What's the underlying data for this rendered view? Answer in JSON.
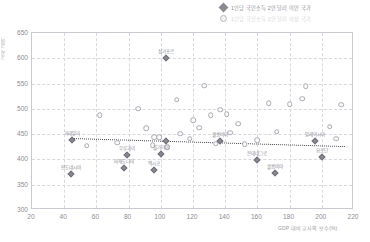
{
  "legend": {
    "items": [
      {
        "marker": "diamond",
        "label": "1인당 국민소득 2만 달러 미만 국가",
        "faint": false
      },
      {
        "marker": "circle",
        "label": "1인당 국민소득 2만 달러 이상 국가",
        "faint": true
      }
    ]
  },
  "chart_data": {
    "type": "scatter",
    "title": "",
    "xlabel": "GDP 대비 교사의 보수(%)",
    "ylabel": "교사 급여",
    "xlim": [
      20,
      220
    ],
    "ylim": [
      300,
      650
    ],
    "xticks": [
      20,
      40,
      60,
      80,
      100,
      120,
      140,
      160,
      180,
      200,
      220
    ],
    "yticks": [
      300,
      350,
      400,
      450,
      500,
      550,
      600,
      650
    ],
    "grid": true,
    "legend_position": "top-right",
    "series": [
      {
        "name": "1인당 국민소득 2만 달러 미만 국가",
        "marker": "diamond",
        "points": [
          {
            "x": 103,
            "y": 601,
            "label": "싱가포르"
          },
          {
            "x": 45,
            "y": 438,
            "label": "과테말라"
          },
          {
            "x": 44,
            "y": 371,
            "label": "인도네시아"
          },
          {
            "x": 79,
            "y": 408,
            "label": "우루과이"
          },
          {
            "x": 77,
            "y": 383,
            "label": "마케도니아"
          },
          {
            "x": 100,
            "y": 411,
            "label": "불가리아"
          },
          {
            "x": 96,
            "y": 379,
            "label": "멕시코"
          },
          {
            "x": 103,
            "y": 436,
            "label": ""
          },
          {
            "x": 137,
            "y": 437,
            "label": "콜롬비아"
          },
          {
            "x": 160,
            "y": 399,
            "label": "몬테네그로"
          },
          {
            "x": 171,
            "y": 374,
            "label": "콜롬비아"
          },
          {
            "x": 196,
            "y": 437,
            "label": "말레이시아"
          },
          {
            "x": 200,
            "y": 404,
            "label": "요르단"
          }
        ]
      },
      {
        "name": "1인당 국민소득 2만 달러 이상 국가",
        "marker": "circle",
        "points": [
          {
            "x": 54,
            "y": 427,
            "label": ""
          },
          {
            "x": 62,
            "y": 487,
            "label": ""
          },
          {
            "x": 73,
            "y": 433,
            "label": ""
          },
          {
            "x": 86,
            "y": 500,
            "label": ""
          },
          {
            "x": 91,
            "y": 462,
            "label": ""
          },
          {
            "x": 95,
            "y": 428,
            "label": ""
          },
          {
            "x": 96,
            "y": 444,
            "label": ""
          },
          {
            "x": 99,
            "y": 444,
            "label": ""
          },
          {
            "x": 104,
            "y": 424,
            "label": ""
          },
          {
            "x": 110,
            "y": 518,
            "label": ""
          },
          {
            "x": 112,
            "y": 451,
            "label": ""
          },
          {
            "x": 118,
            "y": 441,
            "label": ""
          },
          {
            "x": 120,
            "y": 477,
            "label": ""
          },
          {
            "x": 124,
            "y": 463,
            "label": ""
          },
          {
            "x": 127,
            "y": 546,
            "label": ""
          },
          {
            "x": 131,
            "y": 488,
            "label": ""
          },
          {
            "x": 134,
            "y": 431,
            "label": ""
          },
          {
            "x": 137,
            "y": 498,
            "label": ""
          },
          {
            "x": 141,
            "y": 490,
            "label": ""
          },
          {
            "x": 143,
            "y": 453,
            "label": ""
          },
          {
            "x": 148,
            "y": 471,
            "label": ""
          },
          {
            "x": 152,
            "y": 430,
            "label": ""
          },
          {
            "x": 160,
            "y": 438,
            "label": ""
          },
          {
            "x": 167,
            "y": 511,
            "label": ""
          },
          {
            "x": 172,
            "y": 455,
            "label": ""
          },
          {
            "x": 180,
            "y": 509,
            "label": ""
          },
          {
            "x": 188,
            "y": 520,
            "label": ""
          },
          {
            "x": 190,
            "y": 545,
            "label": ""
          },
          {
            "x": 205,
            "y": 465,
            "label": ""
          },
          {
            "x": 209,
            "y": 441,
            "label": ""
          },
          {
            "x": 212,
            "y": 508,
            "label": ""
          }
        ]
      }
    ],
    "trendline": {
      "x0": 44,
      "y0": 443,
      "x1": 214,
      "y1": 427,
      "style": "dotted"
    }
  }
}
